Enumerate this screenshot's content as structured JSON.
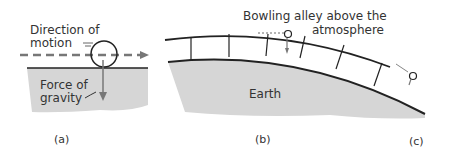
{
  "panels": {
    "a": {
      "caption": "(a)",
      "motion_label_line1": "Direction of",
      "motion_label_line2": "motion",
      "gravity_label_line1": "Force of",
      "gravity_label_line2": "gravity"
    },
    "b": {
      "caption": "(b)",
      "bowling_label_line1": "Bowling alley above the",
      "bowling_label_line2": "atmosphere",
      "earth_label": "Earth"
    },
    "c": {
      "caption": "(c)"
    }
  },
  "colors": {
    "ground": "#d6d6d6",
    "ink": "#222222",
    "arrow": "#777777",
    "text": "#333333"
  }
}
